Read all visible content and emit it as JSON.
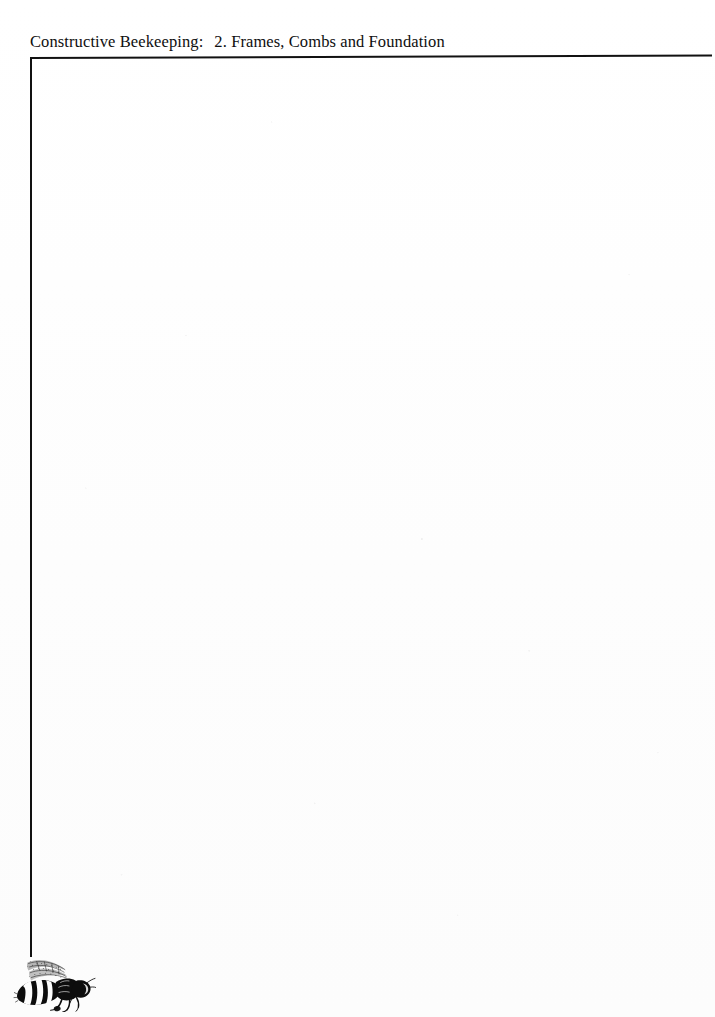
{
  "page": {
    "width": 715,
    "height": 1017,
    "background_color": "#fefefe",
    "ink_color": "#111111",
    "media": "scanned-book-page"
  },
  "running_head": {
    "book_title": "Constructive Beekeeping:",
    "chapter": "2. Frames, Combs and Foundation",
    "full_text": "Constructive Beekeeping:  2. Frames, Combs and Foundation"
  },
  "rules": {
    "header_rule_label": "header-rule",
    "left_margin_rule_label": "left-margin-rule"
  },
  "body": {
    "content": "",
    "note": ""
  },
  "illustration": {
    "name": "honeybee",
    "caption": "",
    "style": "black ink woodcut"
  }
}
